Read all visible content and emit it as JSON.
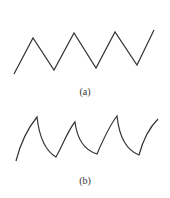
{
  "figure": {
    "panels": [
      {
        "id": "a",
        "label": "(a)",
        "waveform": "triangle",
        "points": [
          [
            14,
            74
          ],
          [
            33,
            38
          ],
          [
            54,
            70
          ],
          [
            74,
            33
          ],
          [
            96,
            68
          ],
          [
            115,
            32
          ],
          [
            137,
            65
          ],
          [
            154,
            30
          ]
        ]
      },
      {
        "id": "b",
        "label": "(b)",
        "waveform": "sawtooth-exponential",
        "points": [
          [
            16,
            161
          ],
          [
            37,
            117
          ],
          [
            56,
            157
          ],
          [
            75,
            122
          ],
          [
            97,
            154
          ],
          [
            117,
            116
          ],
          [
            139,
            155
          ],
          [
            158,
            119
          ]
        ]
      }
    ],
    "stroke_color": "#333333"
  }
}
